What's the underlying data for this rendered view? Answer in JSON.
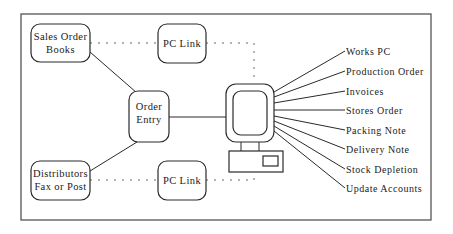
{
  "diagram": {
    "nodes": {
      "sales_order_books": [
        "Sales Order",
        "Books"
      ],
      "pc_link_top": [
        "PC Link"
      ],
      "order_entry": [
        "Order",
        "Entry"
      ],
      "distributors": [
        "Distributors",
        "Fax or Post"
      ],
      "pc_link_bottom": [
        "PC Link"
      ]
    },
    "computer": {
      "icon": "computer-icon"
    },
    "outputs": [
      "Works PC",
      "Production Order",
      "Invoices",
      "Stores Order",
      "Packing Note",
      "Delivery Note",
      "Stock Depletion",
      "Update Accounts"
    ],
    "edges": [
      {
        "from": "Sales Order Books",
        "to": "Order Entry",
        "style": "solid"
      },
      {
        "from": "Distributors Fax or Post",
        "to": "Order Entry",
        "style": "solid"
      },
      {
        "from": "Order Entry",
        "to": "Computer",
        "style": "solid"
      },
      {
        "from": "Sales Order Books",
        "to": "Computer",
        "via": "PC Link",
        "style": "dotted"
      },
      {
        "from": "Distributors Fax or Post",
        "to": "Computer",
        "via": "PC Link",
        "style": "dotted"
      },
      {
        "from": "Computer",
        "to": "outputs",
        "style": "solid"
      }
    ]
  }
}
